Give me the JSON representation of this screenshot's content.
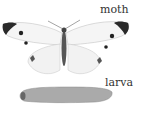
{
  "figure": {
    "labels": {
      "moth": "moth",
      "larva": "larva"
    },
    "subjects": [
      "moth",
      "larva"
    ],
    "colors": {
      "background": "#ffffff",
      "ink": "#333333",
      "wing": "#f4f4f4",
      "wing_tip": "#2a2a2a",
      "larva_body": "#a9a9a9"
    }
  }
}
